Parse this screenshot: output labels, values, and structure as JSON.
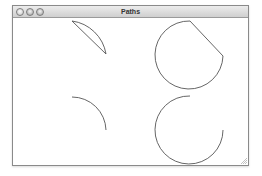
{
  "window": {
    "title": "Paths",
    "buttons": [
      {
        "name": "close",
        "icon": "close-icon"
      },
      {
        "name": "minimize",
        "icon": "minimize-icon"
      },
      {
        "name": "zoom",
        "icon": "zoom-icon"
      }
    ]
  },
  "canvas": {
    "stroke_color": "#555555",
    "shapes": [
      {
        "name": "arc-chord-segment",
        "description": "arc closed with straight chord"
      },
      {
        "name": "arc-wedge-circle",
        "description": "near-full circle with straight closing segment"
      },
      {
        "name": "open-quarter-arc",
        "description": "open arc quarter"
      },
      {
        "name": "open-three-quarter-arc",
        "description": "open arc three-quarter circle"
      }
    ]
  }
}
